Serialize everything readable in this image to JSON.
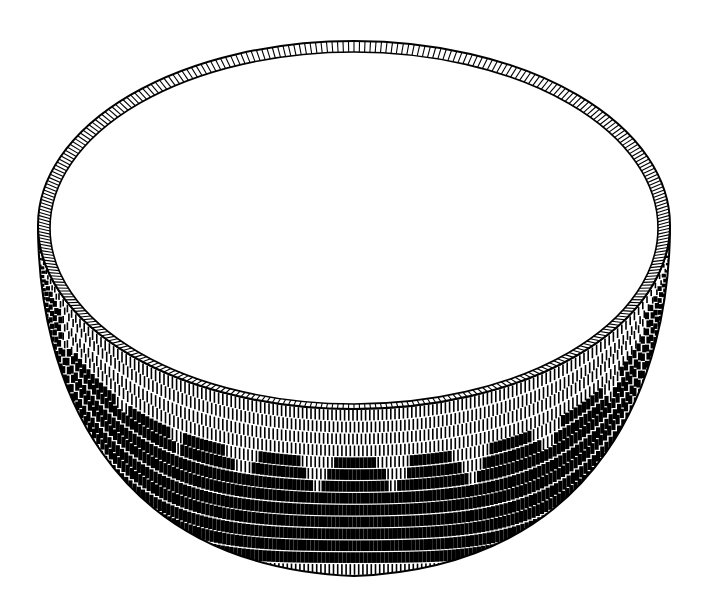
{
  "image": {
    "subject": "woven-basket-illustration",
    "style": "black ink line drawing",
    "background": "#ffffff",
    "ink": "#000000",
    "rim": {
      "cx": 354,
      "cy": 225,
      "rx": 316,
      "ry": 184
    },
    "inner": {
      "cx": 354,
      "cy": 228,
      "rx": 304,
      "ry": 176
    },
    "body_bottom_y": 576,
    "pattern": {
      "motif": "stepped triangles",
      "peaks_x": [
        95,
        148,
        205,
        278,
        355,
        432,
        510,
        580,
        640
      ],
      "band_rows": 14
    }
  }
}
